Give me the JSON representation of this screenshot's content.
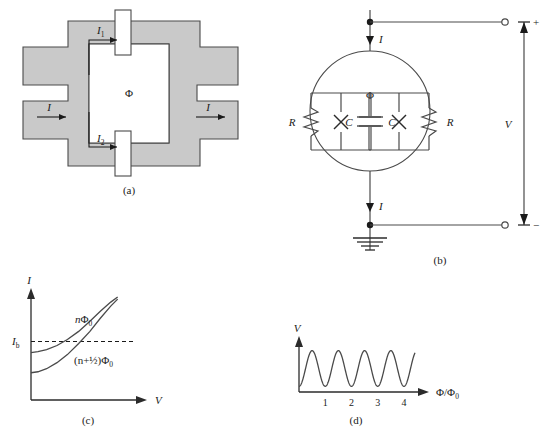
{
  "figure": {
    "colors": {
      "superconductor_fill": "#c9c9c9",
      "stroke": "#4a4a4a",
      "dark_stroke": "#2b2b2b",
      "background": "#ffffff",
      "text": "#1a1a1a"
    }
  },
  "panel_a": {
    "label": "(a)",
    "current_in": "I",
    "current_out": "I",
    "branch_current_1_base": "I",
    "branch_current_1_sub": "1",
    "branch_current_2_base": "I",
    "branch_current_2_sub": "2",
    "flux_symbol": "Φ"
  },
  "panel_b": {
    "label": "(b)",
    "current_top": "I",
    "current_bottom": "I",
    "flux_symbol": "Φ",
    "resistor_left": "R",
    "resistor_right": "R",
    "capacitor_left": "C",
    "capacitor_right": "C",
    "voltage_label": "V",
    "terminal_plus": "+",
    "terminal_minus": "−",
    "junction_symbol": "x-junction-cross"
  },
  "panel_c": {
    "label": "(c)",
    "ylabel": "I",
    "xlabel": "V",
    "bias_base": "I",
    "bias_sub": "b",
    "curve_upper_label_base": "n",
    "curve_upper_label_flux": "Φ",
    "curve_upper_label_sub": "0",
    "curve_lower_label": "(n+½)Φ",
    "curve_lower_label_sub": "0"
  },
  "panel_d": {
    "label": "(d)",
    "ylabel": "V",
    "xlabel_num": "Φ",
    "xlabel_den": "Φ",
    "xlabel_den_sub": "0",
    "xlabel_slash": "/",
    "ticks": [
      "1",
      "2",
      "3",
      "4"
    ]
  },
  "chart_data": [
    {
      "type": "line",
      "panel": "c",
      "title": "",
      "xlabel": "V",
      "ylabel": "I",
      "grid": false,
      "legend": "inline-annotations",
      "annotations": [
        "nΦ0",
        "(n+1/2)Φ0",
        "Ib"
      ],
      "series": [
        {
          "name": "nΦ_0",
          "comment": "upper branch, higher critical current",
          "x": [
            0,
            0.08,
            0.18,
            0.3,
            0.42,
            0.55,
            0.68,
            0.8,
            0.92,
            1.0
          ],
          "y": [
            0.47,
            0.48,
            0.5,
            0.54,
            0.6,
            0.68,
            0.78,
            0.88,
            0.97,
            1.02
          ]
        },
        {
          "name": "(n+1/2)Φ_0",
          "comment": "lower branch, suppressed critical current",
          "x": [
            0,
            0.08,
            0.18,
            0.3,
            0.42,
            0.55,
            0.68,
            0.8,
            0.92,
            1.0
          ],
          "y": [
            0.27,
            0.28,
            0.31,
            0.37,
            0.45,
            0.56,
            0.68,
            0.81,
            0.93,
            1.0
          ]
        }
      ],
      "reference_lines": [
        {
          "name": "Ib",
          "orientation": "horizontal",
          "value": 0.58,
          "style": "dashed"
        }
      ],
      "xlim": [
        0,
        1.05
      ],
      "ylim": [
        0,
        1.1
      ]
    },
    {
      "type": "line",
      "panel": "d",
      "title": "",
      "xlabel": "Φ/Φ₀",
      "ylabel": "V",
      "grid": false,
      "xticks": [
        1,
        2,
        3,
        4
      ],
      "xlim": [
        0,
        4.6
      ],
      "ylim": [
        0,
        1.15
      ],
      "series": [
        {
          "name": "V(Φ)",
          "comment": "sinusoidal modulation, period 1 flux quantum, approx 4.4 periods shown",
          "function": "V = 0.5 - 0.38*cos(2*pi*Φ/Φ₀)",
          "amplitude": 0.38,
          "offset": 0.5,
          "period": 1.0,
          "phase_at_origin": "minimum"
        }
      ]
    }
  ]
}
